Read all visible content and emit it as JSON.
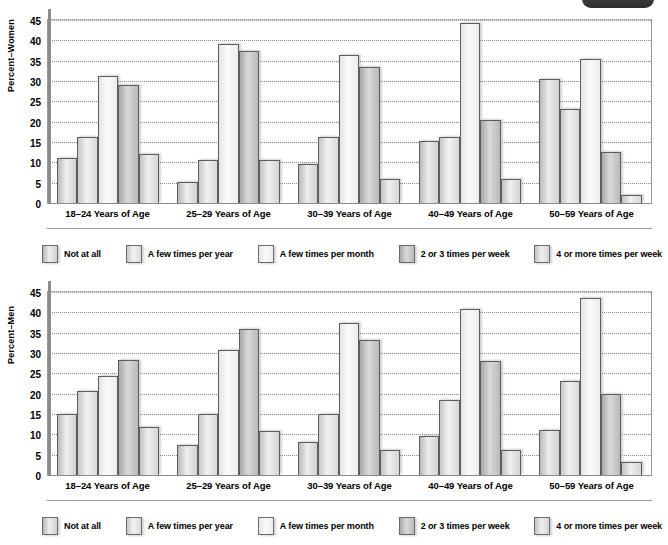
{
  "chart_data": [
    {
      "type": "bar",
      "title": "",
      "ylabel": "Percent–Women",
      "xlabel": "",
      "ylim": [
        0,
        45
      ],
      "yticks": [
        0,
        5,
        10,
        15,
        20,
        25,
        30,
        35,
        40,
        45
      ],
      "grid": true,
      "legend_position": "bottom",
      "categories": [
        "18–24 Years of Age",
        "25–29 Years of Age",
        "30–39 Years of Age",
        "40–49 Years of Age",
        "50–59 Years of Age"
      ],
      "series": [
        {
          "name": "Not at all",
          "values": [
            11.0,
            5.2,
            9.7,
            15.3,
            30.5
          ]
        },
        {
          "name": "A few times per year",
          "values": [
            16.3,
            10.5,
            16.3,
            16.3,
            23.2
          ]
        },
        {
          "name": "A few times per month",
          "values": [
            31.3,
            39.0,
            36.3,
            44.3,
            35.3
          ]
        },
        {
          "name": "2 or 3 times per week",
          "values": [
            29.0,
            37.3,
            33.5,
            20.3,
            12.5
          ]
        },
        {
          "name": "4 or more times per week",
          "values": [
            12.0,
            10.5,
            6.0,
            6.0,
            2.0
          ]
        }
      ]
    },
    {
      "type": "bar",
      "title": "",
      "ylabel": "Percent–Men",
      "xlabel": "",
      "ylim": [
        0,
        45
      ],
      "yticks": [
        0,
        5,
        10,
        15,
        20,
        25,
        30,
        35,
        40,
        45
      ],
      "grid": true,
      "legend_position": "bottom",
      "categories": [
        "18–24 Years of Age",
        "25–29 Years of Age",
        "30–39 Years of Age",
        "40–49 Years of Age",
        "50–59 Years of Age"
      ],
      "series": [
        {
          "name": "Not at all",
          "values": [
            15.1,
            7.4,
            8.0,
            9.5,
            11.0
          ]
        },
        {
          "name": "A few times per year",
          "values": [
            20.7,
            15.1,
            15.0,
            18.5,
            23.2
          ]
        },
        {
          "name": "A few times per month",
          "values": [
            24.4,
            30.7,
            37.3,
            40.8,
            43.5
          ]
        },
        {
          "name": "2 or 3 times per week",
          "values": [
            28.2,
            35.8,
            33.2,
            28.0,
            20.0
          ]
        },
        {
          "name": "4 or more times per week",
          "values": [
            11.8,
            10.8,
            6.2,
            6.2,
            3.2
          ]
        }
      ]
    }
  ],
  "panels": [
    {
      "ylabel": "Percent–Women",
      "yticks": [
        "45",
        "40",
        "35",
        "30",
        "25",
        "20",
        "15",
        "10",
        "5",
        "0"
      ],
      "categories": [
        "18–24 Years of Age",
        "25–29 Years of Age",
        "30–39 Years of Age",
        "40–49 Years of Age",
        "50–59 Years of Age"
      ],
      "legend": [
        "Not at all",
        "A few times per year",
        "A few times per month",
        "2 or 3 times per week",
        "4 or more times per week"
      ]
    },
    {
      "ylabel": "Percent–Men",
      "yticks": [
        "45",
        "40",
        "35",
        "30",
        "25",
        "20",
        "15",
        "10",
        "5",
        "0"
      ],
      "categories": [
        "18–24 Years of Age",
        "25–29 Years of Age",
        "30–39 Years of Age",
        "40–49 Years of Age",
        "50–59 Years of Age"
      ],
      "legend": [
        "Not at all",
        "A few times per year",
        "A few times per month",
        "2 or 3 times per week",
        "4 or more times per week"
      ]
    }
  ]
}
